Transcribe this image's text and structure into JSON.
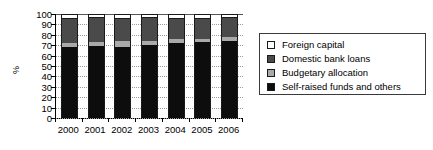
{
  "chart_data": {
    "type": "bar",
    "subtype": "stacked-bar-100",
    "title": "",
    "xlabel": "",
    "ylabel": "%",
    "ylim": [
      0,
      100
    ],
    "ytick_step": 10,
    "yticks": [
      0,
      10,
      20,
      30,
      40,
      50,
      60,
      70,
      80,
      90,
      100
    ],
    "grid": true,
    "grid_style": "dotted-horizontal",
    "legend_position": "right",
    "categories": [
      "2000",
      "2001",
      "2002",
      "2003",
      "2004",
      "2005",
      "2006"
    ],
    "series": [
      {
        "name": "Self-raised funds and others",
        "color": "#0d0d0d",
        "values": [
          68,
          69,
          68,
          70,
          72,
          73,
          74
        ]
      },
      {
        "name": "Budgetary allocation",
        "color": "#a9a9a9",
        "values": [
          4,
          4,
          6,
          4,
          4,
          3,
          4
        ]
      },
      {
        "name": "Domestic bank loans",
        "color": "#4a4a4a",
        "values": [
          23,
          23,
          21,
          22,
          19,
          19,
          18
        ]
      },
      {
        "name": "Foreign capital",
        "color": "#ffffff",
        "values": [
          5,
          4,
          5,
          4,
          5,
          5,
          4
        ]
      }
    ],
    "stack_order_bottom_to_top": [
      "Self-raised funds and others",
      "Budgetary allocation",
      "Domestic bank loans",
      "Foreign capital"
    ],
    "cumulative_tops": {
      "2000": {
        "self_raised": 68,
        "budgetary": 72,
        "domestic": 95,
        "foreign": 100
      },
      "2001": {
        "self_raised": 69,
        "budgetary": 73,
        "domestic": 96,
        "foreign": 100
      },
      "2002": {
        "self_raised": 68,
        "budgetary": 74,
        "domestic": 95,
        "foreign": 100
      },
      "2003": {
        "self_raised": 70,
        "budgetary": 74,
        "domestic": 96,
        "foreign": 100
      },
      "2004": {
        "self_raised": 72,
        "budgetary": 76,
        "domestic": 95,
        "foreign": 100
      },
      "2005": {
        "self_raised": 73,
        "budgetary": 76,
        "domestic": 95,
        "foreign": 100
      },
      "2006": {
        "self_raised": 74,
        "budgetary": 78,
        "domestic": 96,
        "foreign": 100
      }
    }
  },
  "axis": {
    "y_title": "%",
    "y_labels": [
      "100",
      "90",
      "80",
      "70",
      "60",
      "50",
      "40",
      "30",
      "20",
      "10",
      "0"
    ],
    "x_labels": [
      "2000",
      "2001",
      "2002",
      "2003",
      "2004",
      "2005",
      "2006"
    ]
  },
  "legend": {
    "items": [
      {
        "label": "Foreign capital",
        "color": "#ffffff"
      },
      {
        "label": "Domestic bank loans",
        "color": "#4a4a4a"
      },
      {
        "label": "Budgetary allocation",
        "color": "#a9a9a9"
      },
      {
        "label": "Self-raised funds and others",
        "color": "#0d0d0d"
      }
    ]
  }
}
